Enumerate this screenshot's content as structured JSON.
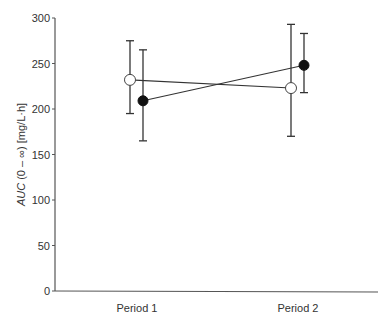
{
  "chart_data": {
    "type": "line",
    "title": "",
    "xlabel": "",
    "ylabel": "AUC (0 – ∞) [mg/L·h]",
    "ylabel_parts": {
      "italic": "AUC",
      "rest": " (0 – ∞) [mg/L·h]"
    },
    "categories": [
      "Period 1",
      "Period 2"
    ],
    "ylim": [
      0,
      300
    ],
    "yticks": [
      0,
      50,
      100,
      150,
      200,
      250,
      300
    ],
    "grid": false,
    "legend": null,
    "series": [
      {
        "name": "open-circle",
        "marker": "open-circle",
        "values": [
          232,
          223
        ],
        "error_upper": [
          275,
          293
        ],
        "error_lower": [
          195,
          170
        ]
      },
      {
        "name": "filled-circle",
        "marker": "filled-circle",
        "values": [
          209,
          248
        ],
        "error_upper": [
          265,
          283
        ],
        "error_lower": [
          165,
          218
        ]
      }
    ]
  },
  "colors": {
    "axis": "#555555",
    "line": "#333333",
    "marker": "#111111"
  }
}
